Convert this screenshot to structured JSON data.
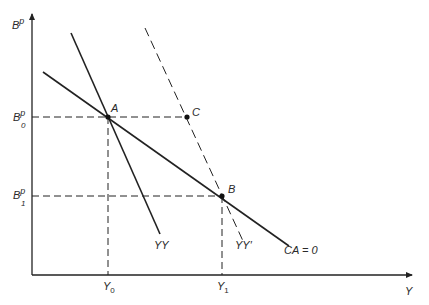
{
  "diagram": {
    "axes": {
      "y_label": "B",
      "y_label_sup": "p",
      "x_label": "Y"
    },
    "ticks": {
      "x": [
        {
          "main": "Y",
          "sub": "0"
        },
        {
          "main": "Y",
          "sub": "1"
        }
      ],
      "y": [
        {
          "main": "B",
          "sup": "p",
          "sub": "0"
        },
        {
          "main": "B",
          "sup": "p",
          "sub": "1"
        }
      ]
    },
    "points": {
      "a": "A",
      "b": "B",
      "c": "C"
    },
    "curves": {
      "yy": "YY",
      "yy_prime": "YY′",
      "ca": "CA = 0"
    },
    "colors": {
      "ink": "#222222",
      "background": "#ffffff"
    }
  }
}
